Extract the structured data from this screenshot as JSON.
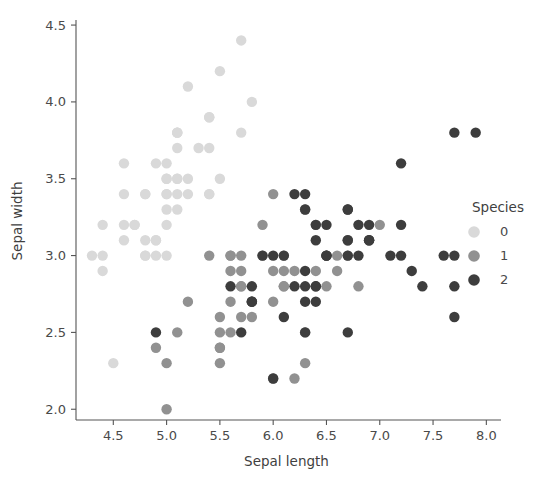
{
  "chart_data": {
    "type": "scatter",
    "title": "",
    "xlabel": "Sepal length",
    "ylabel": "Sepal width",
    "xlim": [
      4.15,
      8.1
    ],
    "ylim": [
      1.93,
      4.52
    ],
    "xticks": [
      "4.5",
      "5.0",
      "5.5",
      "6.0",
      "6.5",
      "7.0",
      "7.5",
      "8.0"
    ],
    "xtick_values": [
      4.5,
      5.0,
      5.5,
      6.0,
      6.5,
      7.0,
      7.5,
      8.0
    ],
    "yticks": [
      "2.0",
      "2.5",
      "3.0",
      "3.5",
      "4.0",
      "4.5"
    ],
    "ytick_values": [
      2.0,
      2.5,
      3.0,
      3.5,
      4.0,
      4.5
    ],
    "grid": false,
    "legend": {
      "title": "Species",
      "position": "right",
      "entries": [
        {
          "label": "0",
          "color": "#d9d9d9"
        },
        {
          "label": "1",
          "color": "#919191"
        },
        {
          "label": "2",
          "color": "#3d3d3d"
        }
      ]
    },
    "marker_size": 5.2,
    "series": [
      {
        "name": "0",
        "color": "#d9d9d9",
        "points": [
          [
            5.1,
            3.5
          ],
          [
            4.9,
            3.0
          ],
          [
            4.7,
            3.2
          ],
          [
            4.6,
            3.1
          ],
          [
            5.0,
            3.6
          ],
          [
            5.4,
            3.9
          ],
          [
            4.6,
            3.4
          ],
          [
            5.0,
            3.4
          ],
          [
            4.4,
            2.9
          ],
          [
            4.9,
            3.1
          ],
          [
            5.4,
            3.7
          ],
          [
            4.8,
            3.4
          ],
          [
            4.8,
            3.0
          ],
          [
            4.3,
            3.0
          ],
          [
            5.8,
            4.0
          ],
          [
            5.7,
            4.4
          ],
          [
            5.4,
            3.9
          ],
          [
            5.1,
            3.5
          ],
          [
            5.7,
            3.8
          ],
          [
            5.1,
            3.8
          ],
          [
            5.4,
            3.4
          ],
          [
            5.1,
            3.7
          ],
          [
            4.6,
            3.6
          ],
          [
            5.1,
            3.3
          ],
          [
            4.8,
            3.4
          ],
          [
            5.0,
            3.0
          ],
          [
            5.0,
            3.4
          ],
          [
            5.2,
            3.5
          ],
          [
            5.2,
            3.4
          ],
          [
            4.7,
            3.2
          ],
          [
            4.8,
            3.1
          ],
          [
            5.4,
            3.4
          ],
          [
            5.2,
            4.1
          ],
          [
            5.5,
            4.2
          ],
          [
            4.9,
            3.1
          ],
          [
            5.0,
            3.2
          ],
          [
            5.5,
            3.5
          ],
          [
            4.9,
            3.6
          ],
          [
            4.4,
            3.0
          ],
          [
            5.1,
            3.4
          ],
          [
            5.0,
            3.5
          ],
          [
            4.5,
            2.3
          ],
          [
            4.4,
            3.2
          ],
          [
            5.0,
            3.5
          ],
          [
            5.1,
            3.8
          ],
          [
            4.8,
            3.0
          ],
          [
            5.1,
            3.8
          ],
          [
            4.6,
            3.2
          ],
          [
            5.3,
            3.7
          ],
          [
            5.0,
            3.3
          ]
        ]
      },
      {
        "name": "1",
        "color": "#919191",
        "points": [
          [
            7.0,
            3.2
          ],
          [
            6.4,
            3.2
          ],
          [
            6.9,
            3.1
          ],
          [
            5.5,
            2.3
          ],
          [
            6.5,
            2.8
          ],
          [
            5.7,
            2.8
          ],
          [
            6.3,
            3.3
          ],
          [
            4.9,
            2.4
          ],
          [
            6.6,
            2.9
          ],
          [
            5.2,
            2.7
          ],
          [
            5.0,
            2.0
          ],
          [
            5.9,
            3.0
          ],
          [
            6.0,
            2.2
          ],
          [
            6.1,
            2.9
          ],
          [
            5.6,
            2.9
          ],
          [
            6.7,
            3.1
          ],
          [
            5.6,
            3.0
          ],
          [
            5.8,
            2.7
          ],
          [
            6.2,
            2.2
          ],
          [
            5.6,
            2.5
          ],
          [
            5.9,
            3.2
          ],
          [
            6.1,
            2.8
          ],
          [
            6.3,
            2.5
          ],
          [
            6.1,
            2.8
          ],
          [
            6.4,
            2.9
          ],
          [
            6.6,
            3.0
          ],
          [
            6.8,
            2.8
          ],
          [
            6.7,
            3.0
          ],
          [
            6.0,
            2.9
          ],
          [
            5.7,
            2.6
          ],
          [
            5.5,
            2.4
          ],
          [
            5.5,
            2.4
          ],
          [
            5.8,
            2.7
          ],
          [
            6.0,
            2.7
          ],
          [
            5.4,
            3.0
          ],
          [
            6.0,
            3.4
          ],
          [
            6.7,
            3.1
          ],
          [
            6.3,
            2.3
          ],
          [
            5.6,
            3.0
          ],
          [
            5.5,
            2.5
          ],
          [
            5.5,
            2.6
          ],
          [
            6.1,
            3.0
          ],
          [
            5.8,
            2.6
          ],
          [
            5.0,
            2.3
          ],
          [
            5.6,
            2.7
          ],
          [
            5.7,
            3.0
          ],
          [
            5.7,
            2.9
          ],
          [
            6.2,
            2.9
          ],
          [
            5.1,
            2.5
          ],
          [
            5.7,
            2.8
          ]
        ]
      },
      {
        "name": "2",
        "color": "#3d3d3d",
        "points": [
          [
            6.3,
            3.3
          ],
          [
            5.8,
            2.7
          ],
          [
            7.1,
            3.0
          ],
          [
            6.3,
            2.9
          ],
          [
            6.5,
            3.0
          ],
          [
            7.6,
            3.0
          ],
          [
            4.9,
            2.5
          ],
          [
            7.3,
            2.9
          ],
          [
            6.7,
            2.5
          ],
          [
            7.2,
            3.6
          ],
          [
            6.5,
            3.2
          ],
          [
            6.4,
            2.7
          ],
          [
            6.8,
            3.0
          ],
          [
            5.7,
            2.5
          ],
          [
            5.8,
            2.8
          ],
          [
            6.4,
            3.2
          ],
          [
            6.5,
            3.0
          ],
          [
            7.7,
            3.8
          ],
          [
            7.7,
            2.6
          ],
          [
            6.0,
            2.2
          ],
          [
            6.9,
            3.2
          ],
          [
            5.6,
            2.8
          ],
          [
            7.7,
            2.8
          ],
          [
            6.3,
            2.7
          ],
          [
            6.7,
            3.3
          ],
          [
            7.2,
            3.2
          ],
          [
            6.2,
            2.8
          ],
          [
            6.1,
            3.0
          ],
          [
            6.4,
            2.8
          ],
          [
            7.2,
            3.0
          ],
          [
            7.4,
            2.8
          ],
          [
            7.9,
            3.8
          ],
          [
            6.4,
            2.8
          ],
          [
            6.3,
            2.8
          ],
          [
            6.1,
            2.6
          ],
          [
            7.7,
            3.0
          ],
          [
            6.3,
            3.4
          ],
          [
            6.4,
            3.1
          ],
          [
            6.0,
            3.0
          ],
          [
            6.9,
            3.1
          ],
          [
            6.7,
            3.1
          ],
          [
            6.9,
            3.1
          ],
          [
            5.8,
            2.7
          ],
          [
            6.8,
            3.2
          ],
          [
            6.7,
            3.3
          ],
          [
            6.7,
            3.0
          ],
          [
            6.3,
            2.5
          ],
          [
            6.5,
            3.0
          ],
          [
            6.2,
            3.4
          ],
          [
            5.9,
            3.0
          ]
        ]
      }
    ]
  },
  "axes_geometry": {
    "plot_left": 76,
    "plot_right": 497,
    "plot_top": 22,
    "plot_bottom": 420,
    "legend_x": 470,
    "legend_title_y": 212
  }
}
